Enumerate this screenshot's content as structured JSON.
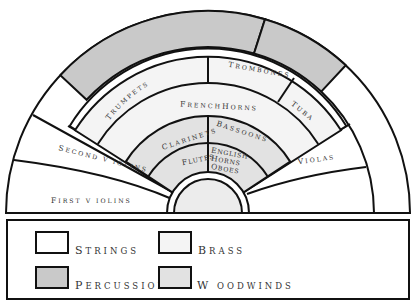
{
  "diagram": {
    "type": "orchestra-seating",
    "colors": {
      "strings": "#ffffff",
      "brass": "#f4f4f4",
      "percussion": "#c9c9c9",
      "woodwinds": "#e2e2e2",
      "podium": "#ececec",
      "stroke": "#111111"
    },
    "sections": {
      "first_violins": {
        "first": "F",
        "rest": "IRST V IOLINS",
        "family": "strings"
      },
      "second_violins": {
        "first": "S",
        "rest": "ECOND V IOLINS",
        "family": "strings"
      },
      "violas": {
        "first": "V",
        "rest": "IOLAS",
        "family": "strings"
      },
      "trumpets": {
        "first": "T",
        "rest": "RUMPETS",
        "family": "brass"
      },
      "trombones": {
        "first": "T",
        "rest": "ROMBONES",
        "family": "brass"
      },
      "tuba": {
        "first": "T",
        "rest": "UBA",
        "family": "brass"
      },
      "french_horns": {
        "first": "F",
        "rest": "RENCH",
        "first2": "H",
        "rest2": "ORNS",
        "family": "brass"
      },
      "clarinets": {
        "first": "C",
        "rest": "LARINETS",
        "family": "woodwinds"
      },
      "bassoons": {
        "first": "B",
        "rest": "ASSOONS",
        "family": "woodwinds"
      },
      "flutes": {
        "first": "F",
        "rest": "LUTES",
        "family": "woodwinds"
      },
      "english_horns": {
        "line1_first": "E",
        "line1_rest": "NGLISH",
        "line2_first": "H",
        "line2_rest": "ORNS",
        "family": "woodwinds"
      },
      "oboes": {
        "first": "O",
        "rest": "BOES",
        "family": "woodwinds"
      },
      "percussion_band": {
        "family": "percussion"
      }
    }
  },
  "legend": {
    "items": [
      {
        "key": "strings",
        "first": "S",
        "rest": "TRINGS"
      },
      {
        "key": "brass",
        "first": "B",
        "rest": "RASS"
      },
      {
        "key": "percussion",
        "first": "P",
        "rest": "ERCUSSION"
      },
      {
        "key": "woodwinds",
        "first": "W",
        "rest": " OODWINDS"
      }
    ]
  }
}
